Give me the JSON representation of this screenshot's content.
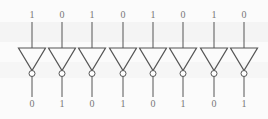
{
  "diagram": {
    "title": "",
    "component": "NOT gate (inverter) array",
    "gate_count": 8,
    "colors": {
      "stroke": "#555555",
      "label": "#777777",
      "background": "#fbfbfb"
    },
    "gates": [
      {
        "input": "1",
        "output": "0"
      },
      {
        "input": "0",
        "output": "1"
      },
      {
        "input": "1",
        "output": "0"
      },
      {
        "input": "0",
        "output": "1"
      },
      {
        "input": "1",
        "output": "0"
      },
      {
        "input": "0",
        "output": "1"
      },
      {
        "input": "1",
        "output": "0"
      },
      {
        "input": "0",
        "output": "1"
      }
    ]
  }
}
